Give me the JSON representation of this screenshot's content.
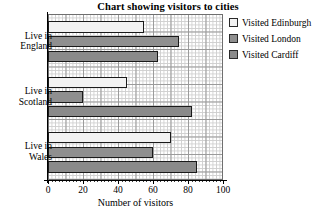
{
  "chart_data": {
    "type": "bar",
    "orientation": "horizontal",
    "title": "Chart showing visitors to cities",
    "xlabel": "Number of visitors",
    "ylabel": "",
    "categories": [
      "Live in\nEngland",
      "Live in\nScotland",
      "Live in\nWales"
    ],
    "series": [
      {
        "name": "Visited Edinburgh",
        "color": "#f2f2f2",
        "values": [
          55,
          45,
          70
        ]
      },
      {
        "name": "Visited London",
        "color": "#8f8f8f",
        "values": [
          75,
          20,
          60
        ]
      },
      {
        "name": "Visited Cardiff",
        "color": "#8a8a8a",
        "values": [
          63,
          82,
          85
        ]
      }
    ],
    "xlim": [
      0,
      100
    ],
    "xticks": [
      0,
      20,
      40,
      60,
      80,
      100
    ],
    "xtick_labels": [
      "0",
      "20",
      "40",
      "60",
      "80",
      "100"
    ],
    "grid": true,
    "grid_minor_step": 2,
    "grid_major_step": 10,
    "legend_position": "top-right"
  },
  "axis": {
    "x_title": "Number of visitors"
  },
  "legend": {
    "items": [
      {
        "label": "Visited Edinburgh"
      },
      {
        "label": "Visited London"
      },
      {
        "label": "Visited Cardiff"
      }
    ]
  }
}
